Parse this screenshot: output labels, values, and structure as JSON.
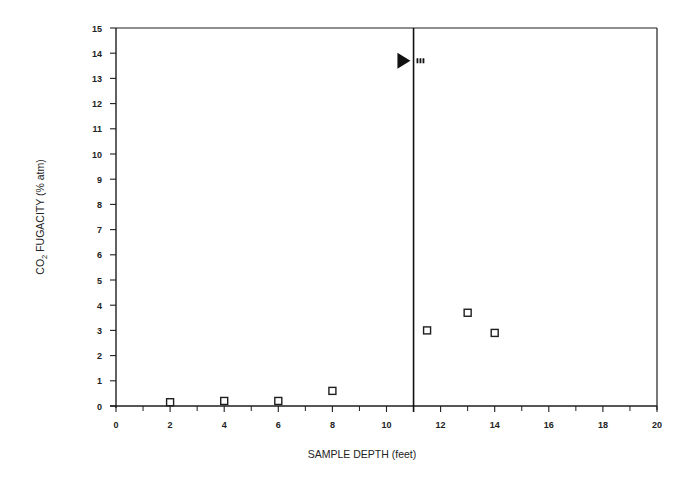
{
  "chart_data": {
    "type": "scatter",
    "title": "",
    "xlabel": "SAMPLE DEPTH (feet)",
    "ylabel": "CO2 FUGACITY (% atm)",
    "ylabel_parts": {
      "pre": "CO",
      "sub": "2",
      "post": " FUGACITY (% atm)"
    },
    "xlim": [
      0,
      20
    ],
    "ylim": [
      0,
      15
    ],
    "x_ticks_major": [
      0,
      2,
      4,
      6,
      8,
      10,
      12,
      14,
      16,
      18,
      20
    ],
    "x_ticks_minor": [
      1,
      3,
      5,
      7,
      9,
      11,
      13,
      15,
      17,
      19
    ],
    "y_ticks": [
      0,
      1,
      2,
      3,
      4,
      5,
      6,
      7,
      8,
      9,
      10,
      11,
      12,
      13,
      14,
      15
    ],
    "grid": false,
    "legend": null,
    "series": [
      {
        "name": "CO2 fugacity",
        "marker": "open-square",
        "points": [
          {
            "x": 2,
            "y": 0.15
          },
          {
            "x": 4,
            "y": 0.2
          },
          {
            "x": 6,
            "y": 0.2
          },
          {
            "x": 8,
            "y": 0.6
          },
          {
            "x": 11.5,
            "y": 3.0
          },
          {
            "x": 13,
            "y": 3.7
          },
          {
            "x": 14,
            "y": 2.9
          }
        ]
      }
    ],
    "annotations": [
      {
        "type": "vertical-line",
        "x": 11,
        "description": "water table / boundary line"
      },
      {
        "type": "filled-triangle-marker",
        "x": 10.7,
        "y": 13.7,
        "label": "water table symbol with dashes"
      }
    ]
  }
}
